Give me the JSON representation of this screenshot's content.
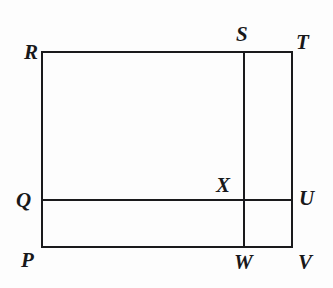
{
  "figure": {
    "kind": "geometry-diagram",
    "background_color": "#fdfdfd",
    "stroke_color": "#1a1a1c",
    "stroke_width": 2,
    "canvas": {
      "width": 333,
      "height": 288
    },
    "labels": [
      {
        "id": "R",
        "text": "R",
        "x": 30,
        "y": 52,
        "anchor": "top-left-corner"
      },
      {
        "id": "S",
        "text": "S",
        "x": 244,
        "y": 35,
        "anchor": "top-of-vertical-segment"
      },
      {
        "id": "T",
        "text": "T",
        "x": 303,
        "y": 42,
        "anchor": "top-right-corner"
      },
      {
        "id": "Q",
        "text": "Q",
        "x": 24,
        "y": 200,
        "anchor": "left-of-horizontal-segment"
      },
      {
        "id": "X",
        "text": "X",
        "x": 225,
        "y": 186,
        "anchor": "intersection-point"
      },
      {
        "id": "U",
        "text": "U",
        "x": 306,
        "y": 199,
        "anchor": "right-of-horizontal-segment"
      },
      {
        "id": "P",
        "text": "P",
        "x": 28,
        "y": 261,
        "anchor": "bottom-left-corner"
      },
      {
        "id": "W",
        "text": "W",
        "x": 242,
        "y": 263,
        "anchor": "bottom-of-vertical-segment"
      },
      {
        "id": "V",
        "text": "V",
        "x": 305,
        "y": 263,
        "anchor": "bottom-right-corner"
      }
    ],
    "points": {
      "P": {
        "x": 42,
        "y": 247
      },
      "Q": {
        "x": 42,
        "y": 200
      },
      "R": {
        "x": 42,
        "y": 52
      },
      "S": {
        "x": 244,
        "y": 52
      },
      "T": {
        "x": 292,
        "y": 52
      },
      "U": {
        "x": 292,
        "y": 200
      },
      "V": {
        "x": 292,
        "y": 247
      },
      "W": {
        "x": 244,
        "y": 247
      },
      "X": {
        "x": 244,
        "y": 200
      }
    },
    "segments": [
      {
        "id": "side-top",
        "from": "R",
        "to": "T",
        "x1": 42,
        "y1": 52,
        "x2": 292,
        "y2": 52
      },
      {
        "id": "side-right",
        "from": "T",
        "to": "V",
        "x1": 292,
        "y1": 52,
        "x2": 292,
        "y2": 247
      },
      {
        "id": "side-bottom",
        "from": "V",
        "to": "P",
        "x1": 292,
        "y1": 247,
        "x2": 42,
        "y2": 247
      },
      {
        "id": "side-left",
        "from": "P",
        "to": "R",
        "x1": 42,
        "y1": 247,
        "x2": 42,
        "y2": 52
      },
      {
        "id": "interior-vertical",
        "from": "S",
        "to": "W",
        "x1": 244,
        "y1": 52,
        "x2": 244,
        "y2": 247
      },
      {
        "id": "interior-horizontal",
        "from": "Q",
        "to": "U",
        "x1": 42,
        "y1": 200,
        "x2": 292,
        "y2": 200
      }
    ]
  }
}
